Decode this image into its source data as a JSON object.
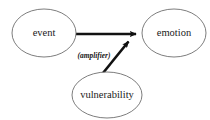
{
  "diagram": {
    "type": "causal-path-diagram",
    "background_color": "#ffffff",
    "node_stroke_color": "#6e6e6e",
    "edge_color": "#111111",
    "text_color": "#1a1a1a",
    "nodes": [
      {
        "id": "event",
        "label": "event",
        "shape": "ellipse",
        "cx": 44,
        "cy": 33,
        "rx": 32,
        "ry": 24
      },
      {
        "id": "emotion",
        "label": "emotion",
        "shape": "ellipse",
        "cx": 174,
        "cy": 33,
        "rx": 32,
        "ry": 24
      },
      {
        "id": "vulnerability",
        "label": "vulnerability",
        "shape": "ellipse",
        "cx": 107,
        "cy": 95,
        "rx": 35,
        "ry": 23
      }
    ],
    "edges": [
      {
        "id": "event-to-emotion",
        "from": "event",
        "to": "emotion",
        "label": "",
        "arrowhead": true,
        "style": "solid-thick",
        "x1": 76,
        "y1": 34,
        "x2": 141,
        "y2": 34
      },
      {
        "id": "vulnerability-to-emotion",
        "from": "vulnerability",
        "to": "emotion",
        "label": "(amplifier)",
        "arrowhead": true,
        "style": "solid-thick",
        "x1": 103,
        "y1": 73,
        "x2": 133,
        "y2": 36
      }
    ],
    "edge_labels": [
      {
        "id": "amplifier-label",
        "text": "(amplifier)",
        "x": 94,
        "y": 56
      }
    ]
  }
}
